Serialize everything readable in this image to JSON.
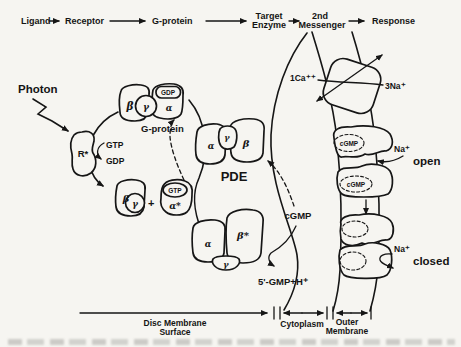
{
  "figure": {
    "header": {
      "ligand": "Ligand",
      "receptor": "Receptor",
      "g_protein": "G-protein",
      "target_line1": "Target",
      "target_line2": "Enzyme",
      "messenger_line1": "2nd",
      "messenger_line2": "Messenger",
      "response": "Response"
    },
    "cascade": {
      "photon": "Photon",
      "activated_receptor": "R*",
      "gtp": "GTP",
      "gdp": "GDP",
      "g_protein": {
        "beta": "β",
        "gamma": "γ",
        "alpha": "α",
        "bound_gdp": "GDP",
        "label": "G-protein"
      },
      "beta_gamma": {
        "beta": "β",
        "gamma": "γ",
        "plus": "+"
      },
      "alpha_gtp": {
        "bound_gtp": "GTP",
        "alpha": "α*"
      },
      "pde_inactive": {
        "alpha": "α",
        "gamma": "γ",
        "beta": "β",
        "label": "PDE"
      },
      "pde_active": {
        "alpha": "α",
        "beta": "β*",
        "gamma": "γ"
      },
      "cgmp": "cGMP",
      "hydrolysis_product": "5'-GMP+H⁺"
    },
    "membrane": {
      "exchanger": {
        "calcium": "1Ca⁺⁺",
        "sodium": "3Na⁺"
      },
      "open_channel": {
        "cgmp_top": "cGMP",
        "cgmp_bottom": "cGMP",
        "sodium": "Na⁺",
        "state": "open"
      },
      "closed_channel": {
        "sodium": "Na⁺",
        "state": "closed"
      }
    },
    "regions": {
      "disc_line1": "Disc Membrane",
      "disc_line2": "Surface",
      "cytoplasm": "Cytoplasm",
      "outer_line1": "Outer",
      "outer_line2": "Membrane"
    }
  }
}
